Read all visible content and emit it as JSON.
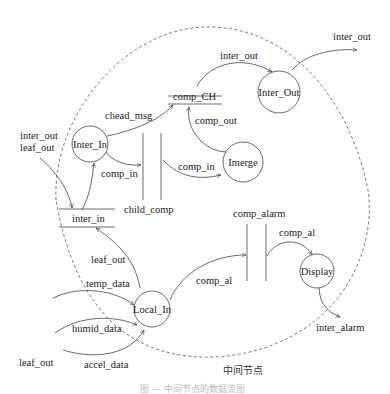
{
  "diagram": {
    "type": "data-flow-diagram",
    "boundary_label": "中间节点",
    "caption": "图 — 中间节点的数据流图",
    "processes": [
      {
        "id": "inter_in_proc",
        "label": "Inter_In"
      },
      {
        "id": "inter_out_proc",
        "label": "Inter_Out"
      },
      {
        "id": "imerge",
        "label": "Imerge"
      },
      {
        "id": "local_in",
        "label": "Local_In"
      },
      {
        "id": "display",
        "label": "Display"
      }
    ],
    "stores": [
      {
        "id": "comp_ch",
        "label": "comp_CH"
      },
      {
        "id": "child_comp",
        "label": "child_comp"
      },
      {
        "id": "inter_in_store",
        "label": "inter_in"
      },
      {
        "id": "comp_alarm",
        "label": "comp_alarm"
      }
    ],
    "flows": {
      "external_inter_out": "inter_out",
      "external_leaf_out": "leaf_out",
      "chead_msg": "chead_msg",
      "comp_ch_to_interout": "inter_out",
      "interout_external": "inter_out",
      "comp_out": "comp_out",
      "interin_comp_in": "comp_in",
      "childcomp_comp_in": "comp_in",
      "localin_leaf_out": "leaf_out",
      "temp_data": "temp_data",
      "humid_data": "humid_data",
      "accel_data": "accel_data",
      "leaf_out_ext": "leaf_out",
      "localin_comp_al": "comp_al",
      "alarm_comp_al": "comp_al",
      "inter_alarm": "inter_alarm"
    }
  }
}
